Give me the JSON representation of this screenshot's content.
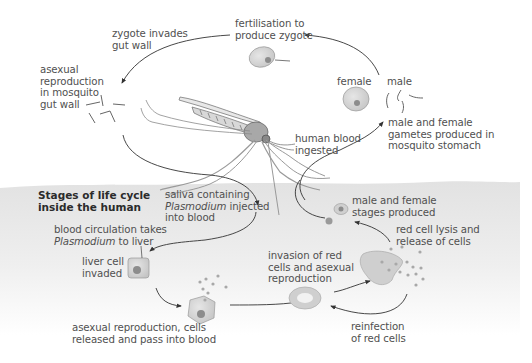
{
  "diagram": {
    "section_title": [
      "Stages of life cycle",
      "inside the human"
    ],
    "mosquito_stages": {
      "fertilisation": [
        "fertilisation to",
        "produce zygote"
      ],
      "zygote_invades": [
        "zygote invades",
        "gut wall"
      ],
      "asexual_gut": [
        "asexual",
        "reproduction",
        "in mosquito",
        "gut wall"
      ],
      "female_label": "female",
      "male_label": "male",
      "gametes": [
        "male and female",
        "gametes produced in",
        "mosquito stomach"
      ],
      "blood_ingested": [
        "human blood",
        "ingested"
      ]
    },
    "human_stages": {
      "saliva": [
        "saliva containing",
        "Plasmodium",
        " injected",
        "into blood"
      ],
      "circulation": [
        "blood circulation takes",
        "Plasmodium",
        " to liver"
      ],
      "liver_invaded": [
        "liver cell",
        "invaded"
      ],
      "asexual_release": [
        "asexual reproduction, cells",
        "released and pass into blood"
      ],
      "red_invasion": [
        "invasion of red",
        "cells and asexual",
        "reproduction"
      ],
      "lysis": [
        "red cell lysis and",
        "release of cells"
      ],
      "reinfection": [
        "reinfection",
        "of red cells"
      ],
      "sexual_stages": [
        "male and female",
        "stages produced"
      ]
    },
    "colors": {
      "background": "#ffffff",
      "human_band": "#e4e4e4",
      "cell_fill": "#d2d2d2",
      "nucleus": "#8c8c8c",
      "arrow": "#333333",
      "text": "#505050"
    }
  }
}
